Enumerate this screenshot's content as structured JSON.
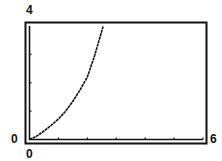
{
  "chart_data": {
    "type": "line",
    "title": "",
    "xlabel": "",
    "ylabel": "",
    "xlim": [
      0,
      6
    ],
    "ylim": [
      0,
      4
    ],
    "x_tick_labels": [
      "0",
      "6"
    ],
    "y_tick_labels": [
      "0",
      "4"
    ],
    "x_ticks": [
      1,
      2,
      3,
      4,
      5,
      6
    ],
    "y_ticks": [
      1,
      2,
      3
    ],
    "grid": false,
    "legend": null,
    "series": [
      {
        "name": "curve",
        "x": [
          0,
          0.25,
          0.5,
          0.75,
          1.0,
          1.25,
          1.5,
          1.75,
          2.0,
          2.25,
          2.55
        ],
        "y": [
          0,
          0.12,
          0.3,
          0.5,
          0.72,
          1.0,
          1.35,
          1.75,
          2.2,
          2.95,
          4.0
        ]
      }
    ]
  },
  "labels": {
    "y_max": "4",
    "y_min": "0",
    "x_min": "0",
    "x_max": "6"
  }
}
